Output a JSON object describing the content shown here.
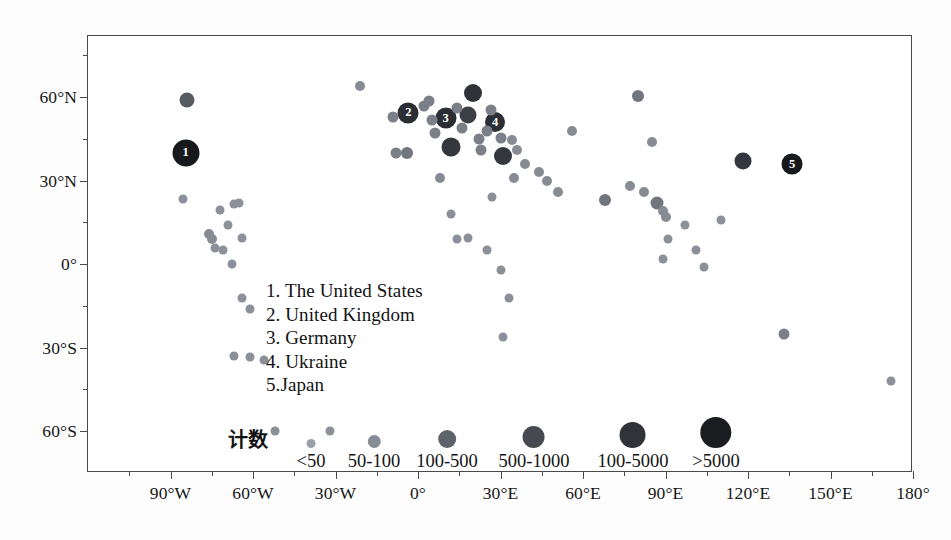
{
  "chart_data": {
    "type": "scatter",
    "title": "",
    "subtitle": "",
    "xlabel": "",
    "ylabel": "",
    "xlim": [
      -120,
      180
    ],
    "ylim": [
      -75,
      82
    ],
    "grid": false,
    "legend_position": "inside-center",
    "x_ticks": [
      {
        "value": -90,
        "label": "90°W"
      },
      {
        "value": -60,
        "label": "60°W"
      },
      {
        "value": -30,
        "label": "30°W"
      },
      {
        "value": 0,
        "label": "0°"
      },
      {
        "value": 30,
        "label": "30°E"
      },
      {
        "value": 60,
        "label": "60°E"
      },
      {
        "value": 90,
        "label": "90°E"
      },
      {
        "value": 120,
        "label": "120°E"
      },
      {
        "value": 150,
        "label": "150°E"
      },
      {
        "value": 180,
        "label": "180°"
      }
    ],
    "x_minor_ticks": [
      -105,
      -75,
      -45,
      -15,
      15,
      45,
      75,
      105,
      135,
      165
    ],
    "y_ticks": [
      {
        "value": 60,
        "label": "60°N"
      },
      {
        "value": 30,
        "label": "30°N"
      },
      {
        "value": 0,
        "label": "0°"
      },
      {
        "value": -30,
        "label": "30°S"
      },
      {
        "value": -60,
        "label": "60°S"
      }
    ],
    "y_minor_ticks": [
      75,
      45,
      15,
      -15,
      -45
    ],
    "size_encoding": "count",
    "points": [
      {
        "x": -84.0,
        "y": 59.0,
        "size": 15,
        "shade": "#565b62",
        "label": ""
      },
      {
        "x": -84.5,
        "y": 40.0,
        "size": 27,
        "shade": "#17191c",
        "label": "1"
      },
      {
        "x": -85.5,
        "y": 23.5,
        "size": 9,
        "shade": "#8b9099",
        "label": ""
      },
      {
        "x": -72.0,
        "y": 19.5,
        "size": 9,
        "shade": "#8b9099",
        "label": ""
      },
      {
        "x": -67.0,
        "y": 21.5,
        "size": 9,
        "shade": "#8b9099",
        "label": ""
      },
      {
        "x": -65.0,
        "y": 22.0,
        "size": 9,
        "shade": "#8b9099",
        "label": ""
      },
      {
        "x": -76.0,
        "y": 11.0,
        "size": 10,
        "shade": "#878c94",
        "label": ""
      },
      {
        "x": -75.0,
        "y": 9.0,
        "size": 10,
        "shade": "#878c94",
        "label": ""
      },
      {
        "x": -74.0,
        "y": 6.0,
        "size": 9,
        "shade": "#8b9099",
        "label": ""
      },
      {
        "x": -71.0,
        "y": 5.0,
        "size": 9,
        "shade": "#8b9099",
        "label": ""
      },
      {
        "x": -69.0,
        "y": 14.0,
        "size": 9,
        "shade": "#8b9099",
        "label": ""
      },
      {
        "x": -64.0,
        "y": 9.5,
        "size": 9,
        "shade": "#8b9099",
        "label": ""
      },
      {
        "x": -67.5,
        "y": 0.0,
        "size": 9,
        "shade": "#8b9099",
        "label": ""
      },
      {
        "x": -64.0,
        "y": -12.0,
        "size": 9,
        "shade": "#8b9099",
        "label": ""
      },
      {
        "x": -61.0,
        "y": -16.0,
        "size": 9,
        "shade": "#8b9099",
        "label": ""
      },
      {
        "x": -67.0,
        "y": -33.0,
        "size": 9,
        "shade": "#8b9099",
        "label": ""
      },
      {
        "x": -61.0,
        "y": -33.5,
        "size": 9,
        "shade": "#8b9099",
        "label": ""
      },
      {
        "x": -56.0,
        "y": -34.5,
        "size": 9,
        "shade": "#8b9099",
        "label": ""
      },
      {
        "x": -52.0,
        "y": -60.0,
        "size": 9,
        "shade": "#8b9099",
        "label": ""
      },
      {
        "x": -32.0,
        "y": -60.0,
        "size": 9,
        "shade": "#8b9099",
        "label": ""
      },
      {
        "x": -21.0,
        "y": 64.0,
        "size": 10,
        "shade": "#878c94",
        "label": ""
      },
      {
        "x": -9.0,
        "y": 53.0,
        "size": 11,
        "shade": "#7a7f88",
        "label": ""
      },
      {
        "x": -8.0,
        "y": 40.0,
        "size": 11,
        "shade": "#7a7f88",
        "label": ""
      },
      {
        "x": -4.0,
        "y": 40.0,
        "size": 12,
        "shade": "#70757e",
        "label": ""
      },
      {
        "x": -3.5,
        "y": 54.5,
        "size": 21,
        "shade": "#2b2f35",
        "label": "2"
      },
      {
        "x": 2.0,
        "y": 57.0,
        "size": 11,
        "shade": "#7a7f88",
        "label": ""
      },
      {
        "x": 4.0,
        "y": 58.5,
        "size": 11,
        "shade": "#7a7f88",
        "label": ""
      },
      {
        "x": 5.0,
        "y": 52.0,
        "size": 11,
        "shade": "#7a7f88",
        "label": ""
      },
      {
        "x": 6.0,
        "y": 47.0,
        "size": 11,
        "shade": "#7a7f88",
        "label": ""
      },
      {
        "x": 10.0,
        "y": 52.5,
        "size": 21,
        "shade": "#2b2f35",
        "label": "3"
      },
      {
        "x": 12.0,
        "y": 42.0,
        "size": 19,
        "shade": "#34383e",
        "label": ""
      },
      {
        "x": 8.0,
        "y": 31.0,
        "size": 10,
        "shade": "#878c94",
        "label": ""
      },
      {
        "x": 14.0,
        "y": 56.0,
        "size": 11,
        "shade": "#7a7f88",
        "label": ""
      },
      {
        "x": 16.0,
        "y": 49.0,
        "size": 11,
        "shade": "#7a7f88",
        "label": ""
      },
      {
        "x": 18.0,
        "y": 53.5,
        "size": 17,
        "shade": "#3c4046",
        "label": ""
      },
      {
        "x": 20.0,
        "y": 61.5,
        "size": 18,
        "shade": "#2f3339",
        "label": ""
      },
      {
        "x": 22.0,
        "y": 45.0,
        "size": 11,
        "shade": "#7a7f88",
        "label": ""
      },
      {
        "x": 23.0,
        "y": 41.0,
        "size": 11,
        "shade": "#7a7f88",
        "label": ""
      },
      {
        "x": 25.0,
        "y": 48.0,
        "size": 11,
        "shade": "#7a7f88",
        "label": ""
      },
      {
        "x": 26.5,
        "y": 55.5,
        "size": 11,
        "shade": "#7a7f88",
        "label": ""
      },
      {
        "x": 28.0,
        "y": 51.0,
        "size": 20,
        "shade": "#2b2f35",
        "label": "4"
      },
      {
        "x": 30.0,
        "y": 45.5,
        "size": 11,
        "shade": "#7a7f88",
        "label": ""
      },
      {
        "x": 31.0,
        "y": 39.0,
        "size": 18,
        "shade": "#34383e",
        "label": ""
      },
      {
        "x": 34.0,
        "y": 44.5,
        "size": 10,
        "shade": "#878c94",
        "label": ""
      },
      {
        "x": 36.0,
        "y": 41.0,
        "size": 10,
        "shade": "#878c94",
        "label": ""
      },
      {
        "x": 35.0,
        "y": 31.0,
        "size": 10,
        "shade": "#878c94",
        "label": ""
      },
      {
        "x": 39.0,
        "y": 36.0,
        "size": 10,
        "shade": "#878c94",
        "label": ""
      },
      {
        "x": 44.0,
        "y": 33.0,
        "size": 10,
        "shade": "#878c94",
        "label": ""
      },
      {
        "x": 47.0,
        "y": 30.0,
        "size": 10,
        "shade": "#878c94",
        "label": ""
      },
      {
        "x": 51.0,
        "y": 26.0,
        "size": 10,
        "shade": "#878c94",
        "label": ""
      },
      {
        "x": 14.0,
        "y": 9.0,
        "size": 9,
        "shade": "#8b9099",
        "label": ""
      },
      {
        "x": 18.0,
        "y": 9.5,
        "size": 9,
        "shade": "#8b9099",
        "label": ""
      },
      {
        "x": 12.0,
        "y": 18.0,
        "size": 9,
        "shade": "#8b9099",
        "label": ""
      },
      {
        "x": 27.0,
        "y": 24.0,
        "size": 9,
        "shade": "#8b9099",
        "label": ""
      },
      {
        "x": 25.0,
        "y": 5.0,
        "size": 9,
        "shade": "#8b9099",
        "label": ""
      },
      {
        "x": 30.0,
        "y": -2.0,
        "size": 9,
        "shade": "#8b9099",
        "label": ""
      },
      {
        "x": 33.0,
        "y": -12.0,
        "size": 9,
        "shade": "#8b9099",
        "label": ""
      },
      {
        "x": 31.0,
        "y": -26.0,
        "size": 9,
        "shade": "#8b9099",
        "label": ""
      },
      {
        "x": 56.0,
        "y": 48.0,
        "size": 10,
        "shade": "#878c94",
        "label": ""
      },
      {
        "x": 68.0,
        "y": 23.0,
        "size": 12,
        "shade": "#70757e",
        "label": ""
      },
      {
        "x": 77.0,
        "y": 28.0,
        "size": 10,
        "shade": "#878c94",
        "label": ""
      },
      {
        "x": 80.0,
        "y": 60.5,
        "size": 12,
        "shade": "#70757e",
        "label": ""
      },
      {
        "x": 82.0,
        "y": 26.0,
        "size": 10,
        "shade": "#878c94",
        "label": ""
      },
      {
        "x": 85.0,
        "y": 44.0,
        "size": 10,
        "shade": "#878c94",
        "label": ""
      },
      {
        "x": 87.0,
        "y": 22.0,
        "size": 13,
        "shade": "#70757e",
        "label": ""
      },
      {
        "x": 89.0,
        "y": 19.0,
        "size": 10,
        "shade": "#878c94",
        "label": ""
      },
      {
        "x": 90.0,
        "y": 17.0,
        "size": 10,
        "shade": "#878c94",
        "label": ""
      },
      {
        "x": 91.0,
        "y": 9.0,
        "size": 9,
        "shade": "#8b9099",
        "label": ""
      },
      {
        "x": 89.0,
        "y": 2.0,
        "size": 9,
        "shade": "#8b9099",
        "label": ""
      },
      {
        "x": 97.0,
        "y": 14.0,
        "size": 9,
        "shade": "#8b9099",
        "label": ""
      },
      {
        "x": 101.0,
        "y": 5.0,
        "size": 9,
        "shade": "#8b9099",
        "label": ""
      },
      {
        "x": 104.0,
        "y": -1.0,
        "size": 9,
        "shade": "#8b9099",
        "label": ""
      },
      {
        "x": 110.0,
        "y": 16.0,
        "size": 9,
        "shade": "#8b9099",
        "label": ""
      },
      {
        "x": 118.0,
        "y": 37.0,
        "size": 17,
        "shade": "#34383e",
        "label": ""
      },
      {
        "x": 136.0,
        "y": 36.0,
        "size": 21,
        "shade": "#17191c",
        "label": "5"
      },
      {
        "x": 133.0,
        "y": -25.0,
        "size": 11,
        "shade": "#7a7f88",
        "label": ""
      },
      {
        "x": 172.0,
        "y": -42.0,
        "size": 9,
        "shade": "#8b9099",
        "label": ""
      }
    ]
  },
  "country_legend": {
    "items": [
      "1. The United States",
      "2. United Kingdom",
      "3. Germany",
      "4. Ukraine",
      "5.Japan"
    ]
  },
  "size_legend": {
    "title": "计数",
    "items": [
      {
        "label": "<50",
        "diameter": 9,
        "color": "#9aa0a8",
        "cx": 311
      },
      {
        "label": "50-100",
        "diameter": 13,
        "color": "#868c95",
        "cx": 374
      },
      {
        "label": "100-500",
        "diameter": 18,
        "color": "#5d636b",
        "cx": 447
      },
      {
        "label": "500-1000",
        "diameter": 22,
        "color": "#46494f",
        "cx": 534
      },
      {
        "label": "100-5000",
        "diameter": 26,
        "color": "#303338",
        "cx": 633
      },
      {
        "label": ">5000",
        "diameter": 31,
        "color": "#1b1d20",
        "cx": 716
      }
    ]
  },
  "colors": {
    "frame": "#4a4a4a",
    "text": "#161616",
    "background": "#ffffff",
    "bubble_light": "#8b9099",
    "bubble_dark": "#17191c"
  }
}
